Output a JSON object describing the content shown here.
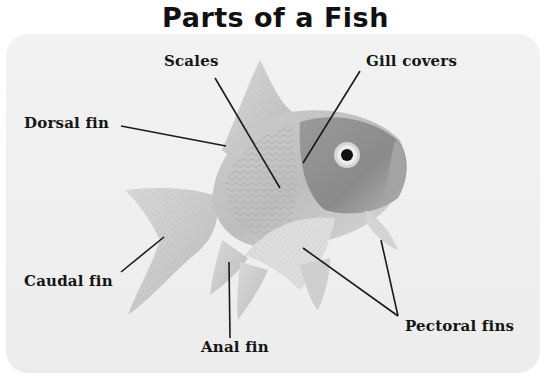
{
  "title": "Parts of a Fish",
  "labels": {
    "scales": "Scales",
    "gill_covers": "Gill covers",
    "dorsal_fin": "Dorsal fin",
    "caudal_fin": "Caudal fin",
    "anal_fin": "Anal fin",
    "pectoral_fins": "Pectoral fins"
  },
  "colors": {
    "leader_line": "#1a1a1a",
    "label_text": "#151515",
    "background": "#efefef"
  }
}
